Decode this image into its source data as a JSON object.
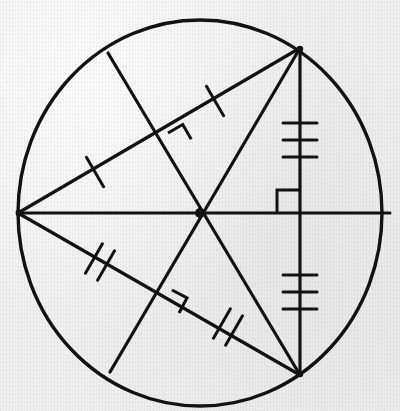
{
  "figure": {
    "background_color": "#f1f1ef",
    "ink_color": "#121212",
    "width": 400,
    "height": 411
  },
  "chart_data": {
    "type": "diagram",
    "subtitle": "",
    "xlabel": "",
    "ylabel": "",
    "grid": false,
    "legend": "none",
    "coordinate_space": {
      "width": 400,
      "height": 411,
      "origin": "top-left",
      "units": "px"
    },
    "circle": {
      "name": "main-circle",
      "center": [
        200,
        213
      ],
      "radius_x": 182,
      "radius_y": 193,
      "stroke_width": 3.4
    },
    "points": [
      {
        "id": "O",
        "label": "",
        "x": 200,
        "y": 213,
        "role": "center"
      },
      {
        "id": "L",
        "label": "",
        "x": 18,
        "y": 213,
        "role": "circle-point-left"
      },
      {
        "id": "R",
        "label": "",
        "x": 390,
        "y": 213,
        "role": "circle-point-right"
      },
      {
        "id": "TR",
        "label": "",
        "x": 300,
        "y": 48,
        "role": "circle-point-upper-right"
      },
      {
        "id": "BR",
        "label": "",
        "x": 300,
        "y": 375,
        "role": "circle-point-lower-right"
      },
      {
        "id": "TL",
        "label": "",
        "x": 108,
        "y": 53,
        "role": "circle-point-upper-left"
      },
      {
        "id": "BL",
        "label": "",
        "x": 110,
        "y": 372,
        "role": "circle-point-lower-left"
      },
      {
        "id": "M1",
        "label": "",
        "x": 160,
        "y": 135,
        "role": "midpoint-upper-chord"
      },
      {
        "id": "M2",
        "label": "",
        "x": 162,
        "y": 290,
        "role": "midpoint-lower-chord"
      }
    ],
    "segments": [
      {
        "id": "seg-horizontal-diameter",
        "from": "L",
        "to": "R",
        "ticks": 0,
        "style": "solid"
      },
      {
        "id": "seg-vertical-chord",
        "from": "TR",
        "to": "BR",
        "ticks": 0,
        "style": "solid"
      },
      {
        "id": "seg-left-to-upper-right",
        "from": "L",
        "to": "TR",
        "ticks": 0,
        "style": "solid"
      },
      {
        "id": "seg-left-to-lower-right",
        "from": "L",
        "to": "BR",
        "ticks": 0,
        "style": "solid"
      },
      {
        "id": "seg-upper-left-to-center-bottom",
        "from": "TL",
        "to": "BR",
        "ticks": 0,
        "style": "solid"
      },
      {
        "id": "seg-lower-left-to-center-top",
        "from": "BL",
        "to": "TR",
        "ticks": 0,
        "style": "solid"
      }
    ],
    "tick_groups": [
      {
        "id": "tick-upper-chord-left-half",
        "on_segment": "seg-left-to-upper-right",
        "count": 1,
        "at": [
          95,
          172
        ],
        "angle_deg": 60
      },
      {
        "id": "tick-upper-chord-right-half",
        "on_segment": "seg-left-to-upper-right",
        "count": 1,
        "at": [
          215,
          96
        ],
        "angle_deg": 60
      },
      {
        "id": "tick-lower-chord-left-half",
        "on_segment": "seg-left-to-lower-right",
        "count": 2,
        "at": [
          100,
          262
        ],
        "angle_deg": 118
      },
      {
        "id": "tick-lower-chord-right-half",
        "on_segment": "seg-left-to-lower-right",
        "count": 2,
        "at": [
          225,
          325
        ],
        "angle_deg": 118
      },
      {
        "id": "tick-vertical-chord-upper",
        "on_segment": "seg-vertical-chord",
        "count": 3,
        "at": [
          300,
          140
        ],
        "angle_deg": 0
      },
      {
        "id": "tick-vertical-chord-lower",
        "on_segment": "seg-vertical-chord",
        "count": 3,
        "at": [
          300,
          292
        ],
        "angle_deg": 0
      }
    ],
    "right_angle_marks": [
      {
        "id": "right-angle-upper-left-crossing",
        "at": [
          168,
          133
        ],
        "size": 17,
        "rotation_deg": 28
      },
      {
        "id": "right-angle-lower-left-crossing",
        "at": [
          170,
          288
        ],
        "size": 17,
        "rotation_deg": -28
      },
      {
        "id": "right-angle-center-right",
        "at": [
          277,
          190
        ],
        "size": 23,
        "rotation_deg": 0
      }
    ],
    "annotations": [
      {
        "id": "note-perpendicular-bisectors",
        "text": "Chords from the left point are perpendicularly bisected by chords through the centre"
      }
    ]
  },
  "elements": {
    "circle_label": "main circle",
    "center_label": "centre point",
    "diameter_label": "horizontal diameter",
    "vertical_chord_label": "vertical chord"
  }
}
